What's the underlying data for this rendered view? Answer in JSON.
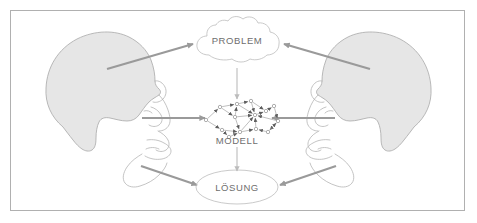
{
  "figure": {
    "title_visible": false,
    "language": "de",
    "background_color": "#ffffff",
    "border_color": "#b0b0b0",
    "head_fill_color": "#e6e6e6",
    "head_outline_color": "#a8a8a8",
    "arrow_color": "#9a9a9a",
    "bubble_outline_color": "#bdbdbd",
    "label_color": "#6e6e6e"
  },
  "nodes": {
    "problem": {
      "label": "PROBLEM",
      "shape": "cloud",
      "cx": 226,
      "cy": 37
    },
    "modell": {
      "label": "MODELL",
      "shape": "network-graph",
      "cx": 226,
      "cy": 110
    },
    "loesung": {
      "label": "LÖSUNG",
      "shape": "ellipse",
      "cx": 226,
      "cy": 176
    }
  },
  "actors": [
    {
      "name": "left-person",
      "orientation": "facing-right",
      "side": "left"
    },
    {
      "name": "right-person",
      "orientation": "facing-left",
      "side": "right"
    }
  ],
  "connections": [
    {
      "from": "left-person-head",
      "to": "problem",
      "style": "thick-arrow"
    },
    {
      "from": "right-person-head",
      "to": "problem",
      "style": "thick-arrow"
    },
    {
      "from": "left-person-eye",
      "to": "modell",
      "style": "thick-arrow"
    },
    {
      "from": "right-person-eye",
      "to": "modell",
      "style": "thick-arrow"
    },
    {
      "from": "left-person-mouth",
      "to": "loesung",
      "style": "thick-arrow"
    },
    {
      "from": "right-person-mouth",
      "to": "loesung",
      "style": "thick-arrow"
    },
    {
      "from": "problem",
      "to": "modell",
      "style": "thin-arrow"
    },
    {
      "from": "modell",
      "to": "loesung",
      "style": "thin-arrow"
    }
  ],
  "graph_nodes": [
    {
      "id": 0,
      "x": 12,
      "y": 21
    },
    {
      "id": 1,
      "x": 26,
      "y": 8
    },
    {
      "id": 2,
      "x": 43,
      "y": 5
    },
    {
      "id": 3,
      "x": 57,
      "y": 2
    },
    {
      "id": 4,
      "x": 41,
      "y": 18
    },
    {
      "id": 5,
      "x": 28,
      "y": 31
    },
    {
      "id": 6,
      "x": 46,
      "y": 33
    },
    {
      "id": 7,
      "x": 62,
      "y": 30
    },
    {
      "id": 8,
      "x": 72,
      "y": 12
    },
    {
      "id": 9,
      "x": 80,
      "y": 7
    },
    {
      "id": 10,
      "x": 84,
      "y": 22
    },
    {
      "id": 11,
      "x": 74,
      "y": 33
    },
    {
      "id": 12,
      "x": 61,
      "y": 16
    },
    {
      "id": 13,
      "x": 35,
      "y": 38
    }
  ],
  "graph_edges": [
    [
      0,
      1
    ],
    [
      1,
      2
    ],
    [
      2,
      3
    ],
    [
      3,
      12
    ],
    [
      1,
      4
    ],
    [
      4,
      2
    ],
    [
      0,
      5
    ],
    [
      5,
      6
    ],
    [
      4,
      6
    ],
    [
      6,
      7
    ],
    [
      7,
      12
    ],
    [
      12,
      8
    ],
    [
      8,
      9
    ],
    [
      9,
      10
    ],
    [
      10,
      11
    ],
    [
      11,
      7
    ],
    [
      3,
      8
    ],
    [
      4,
      12
    ],
    [
      6,
      12
    ],
    [
      5,
      13
    ],
    [
      13,
      6
    ],
    [
      10,
      12
    ],
    [
      11,
      10
    ],
    [
      2,
      12
    ]
  ]
}
